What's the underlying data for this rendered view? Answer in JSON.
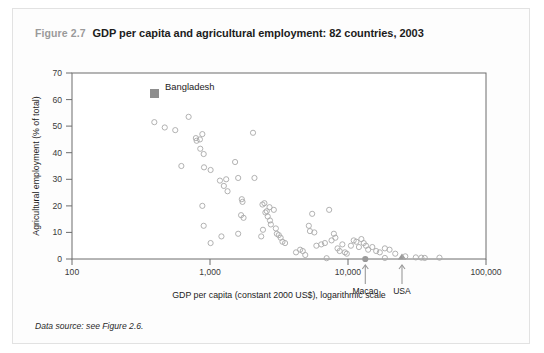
{
  "figure": {
    "number": "Figure 2.7",
    "title": "GDP per capita and agricultural employment: 82 countries, 2003",
    "source": "Data source: see Figure 2.6."
  },
  "chart_data": {
    "type": "scatter",
    "title": "GDP per capita and agricultural employment: 82 countries, 2003",
    "xlabel": "GDP per capita (constant 2000 US$), logarithmic scale",
    "ylabel": "Agricultural employment (% of total)",
    "xscale": "log",
    "xlim": [
      100,
      100000
    ],
    "ylim": [
      0,
      70
    ],
    "xticks": [
      100,
      1000,
      10000,
      100000
    ],
    "xticklabels": [
      "100",
      "1,000",
      "10,000",
      "100,000"
    ],
    "yticks": [
      0,
      10,
      20,
      30,
      40,
      50,
      60,
      70
    ],
    "yticklabels": [
      "0",
      "10",
      "20",
      "30",
      "40",
      "50",
      "60",
      "70"
    ],
    "grid": false,
    "legend": [
      {
        "label": "Bangladesh",
        "marker": "filled-square",
        "color": "#8e8e8e"
      }
    ],
    "annotations": [
      {
        "label": "Macao",
        "x": 19000,
        "y": 0,
        "marker": "filled-circle",
        "arrow": "up"
      },
      {
        "label": "USA",
        "x": 35000,
        "y": 0,
        "marker": "filled-triangle",
        "arrow": "up"
      }
    ],
    "highlight_points": [
      {
        "label": "Bangladesh",
        "x": 390,
        "y": 64,
        "marker": "filled-square"
      }
    ],
    "points": [
      [
        395,
        51.5
      ],
      [
        470,
        49.5
      ],
      [
        560,
        48.5
      ],
      [
        700,
        53.5
      ],
      [
        790,
        45.5
      ],
      [
        800,
        44.5
      ],
      [
        845,
        45.0
      ],
      [
        850,
        41.5
      ],
      [
        880,
        47.0
      ],
      [
        900,
        39.5
      ],
      [
        905,
        34.5
      ],
      [
        620,
        35.0
      ],
      [
        1010,
        33.5
      ],
      [
        1180,
        29.5
      ],
      [
        1260,
        27.5
      ],
      [
        1310,
        30.0
      ],
      [
        1340,
        25.5
      ],
      [
        1520,
        36.5
      ],
      [
        1600,
        30.5
      ],
      [
        1700,
        22.5
      ],
      [
        1720,
        21.5
      ],
      [
        2050,
        47.5
      ],
      [
        2100,
        30.5
      ],
      [
        880,
        20.0
      ],
      [
        900,
        12.5
      ],
      [
        1010,
        6.0
      ],
      [
        1210,
        8.5
      ],
      [
        1600,
        9.5
      ],
      [
        1680,
        16.5
      ],
      [
        1750,
        15.5
      ],
      [
        2400,
        20.5
      ],
      [
        2480,
        21.0
      ],
      [
        2520,
        17.5
      ],
      [
        2580,
        18.0
      ],
      [
        2620,
        16.0
      ],
      [
        2700,
        19.5
      ],
      [
        2720,
        14.5
      ],
      [
        2760,
        13.0
      ],
      [
        2900,
        18.5
      ],
      [
        3000,
        11.5
      ],
      [
        3050,
        9.5
      ],
      [
        3150,
        9.0
      ],
      [
        3250,
        8.0
      ],
      [
        3350,
        6.5
      ],
      [
        3500,
        6.0
      ],
      [
        2420,
        11.0
      ],
      [
        2350,
        8.5
      ],
      [
        4200,
        2.5
      ],
      [
        4500,
        3.5
      ],
      [
        4700,
        3.0
      ],
      [
        4900,
        1.5
      ],
      [
        5200,
        12.5
      ],
      [
        5300,
        10.5
      ],
      [
        5500,
        17.0
      ],
      [
        5700,
        10.0
      ],
      [
        5900,
        5.0
      ],
      [
        6400,
        5.5
      ],
      [
        6800,
        6.0
      ],
      [
        7300,
        18.5
      ],
      [
        7600,
        7.0
      ],
      [
        7900,
        9.5
      ],
      [
        8100,
        8.0
      ],
      [
        8400,
        4.0
      ],
      [
        8700,
        3.0
      ],
      [
        9100,
        5.5
      ],
      [
        9500,
        2.5
      ],
      [
        9800,
        2.0
      ],
      [
        10500,
        5.0
      ],
      [
        11000,
        7.0
      ],
      [
        11500,
        6.5
      ],
      [
        12000,
        4.5
      ],
      [
        12500,
        7.5
      ],
      [
        13000,
        6.0
      ],
      [
        13500,
        5.0
      ],
      [
        14000,
        3.5
      ],
      [
        15000,
        4.5
      ],
      [
        16000,
        3.0
      ],
      [
        17000,
        2.5
      ],
      [
        18500,
        4.0
      ],
      [
        20000,
        3.5
      ],
      [
        22000,
        2.0
      ],
      [
        26000,
        1.0
      ],
      [
        7000,
        0.3
      ],
      [
        18500,
        0.4
      ],
      [
        31000,
        0.6
      ],
      [
        34000,
        0.5
      ],
      [
        36000,
        0.4
      ],
      [
        46000,
        0.5
      ]
    ]
  }
}
